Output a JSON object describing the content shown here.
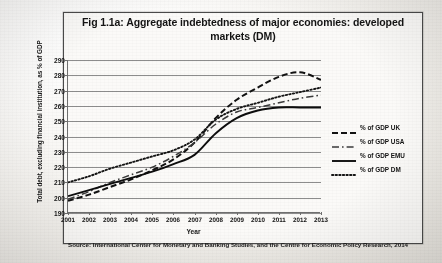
{
  "figure": {
    "title": "Fig 1.1a: Aggregate indebtedness of major economies: developed markets (DM)",
    "source": "Source: International Center for Monetary and Banking Studies, and the Centre for Economic Policy Research, 2014"
  },
  "chart_data": {
    "type": "line",
    "title": "Fig 1.1a: Aggregate indebtedness of major economies: developed markets (DM)",
    "xlabel": "Year",
    "ylabel": "Total debt, excluding financial institution, as % of GDP",
    "x": [
      2001,
      2002,
      2003,
      2004,
      2005,
      2006,
      2007,
      2008,
      2009,
      2010,
      2011,
      2012,
      2013
    ],
    "categories": [
      "2001",
      "2002",
      "2003",
      "2004",
      "2005",
      "2006",
      "2007",
      "2008",
      "2009",
      "2010",
      "2011",
      "2012",
      "2013"
    ],
    "ylim": [
      190,
      290
    ],
    "yticks": [
      190,
      200,
      210,
      220,
      230,
      240,
      250,
      260,
      270,
      280,
      290
    ],
    "grid": true,
    "legend_position": "right",
    "series": [
      {
        "name": "% of GDP UK",
        "style": "dashed",
        "color": "#111111",
        "values": [
          198,
          202,
          207,
          212,
          218,
          225,
          236,
          252,
          264,
          272,
          279,
          282,
          277
        ]
      },
      {
        "name": "% of GDP USA",
        "style": "dash-dot",
        "color": "#3a3a3a",
        "values": [
          199,
          204,
          210,
          215,
          220,
          227,
          236,
          248,
          256,
          259,
          262,
          265,
          267
        ]
      },
      {
        "name": "% of GDP EMU",
        "style": "solid",
        "color": "#0d0d0d",
        "values": [
          201,
          205,
          209,
          213,
          217,
          222,
          228,
          242,
          252,
          257,
          259,
          259,
          259
        ]
      },
      {
        "name": "% of GDP DM",
        "style": "dotted",
        "color": "#141414",
        "values": [
          210,
          214,
          219,
          223,
          227,
          231,
          238,
          251,
          258,
          262,
          266,
          269,
          272
        ]
      }
    ],
    "annotations": [
      "UK peaks at 282 in 2012 then declines to 277 in 2013",
      "EMU plateaus near 259 from 2011 onward"
    ]
  },
  "legend": {
    "items": [
      {
        "label": "% of GDP UK"
      },
      {
        "label": "% of GDP USA"
      },
      {
        "label": "% of GDP EMU"
      },
      {
        "label": "% of GDP DM"
      }
    ]
  }
}
